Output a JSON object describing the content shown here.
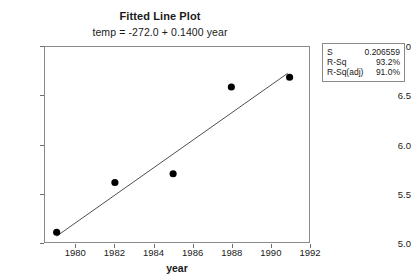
{
  "chart_data": {
    "type": "scatter",
    "title": "Fitted Line Plot",
    "subtitle": "temp =  -272.0 + 0.1400 year",
    "xlabel": "year",
    "ylabel": "temp",
    "xlim": [
      1978.4,
      1992.0
    ],
    "ylim": [
      5.0,
      7.0
    ],
    "grid": false,
    "legend": "none",
    "x": [
      1979,
      1982,
      1985,
      1988,
      1991
    ],
    "y": [
      5.1,
      5.61,
      5.7,
      6.59,
      6.69
    ],
    "xticks": [
      "1980",
      "1982",
      "1984",
      "1986",
      "1988",
      "1990",
      "1992"
    ],
    "xtick_values": [
      1980,
      1982,
      1984,
      1986,
      1988,
      1990,
      1992
    ],
    "yticks": [
      "7.0",
      "6.5",
      "6.0",
      "5.5",
      "5.0"
    ],
    "ytick_values": [
      7.0,
      6.5,
      6.0,
      5.5,
      5.0
    ],
    "series": [
      {
        "name": "observed",
        "type": "scatter",
        "marker": "filled-circle",
        "color": "#000000",
        "values": [
          5.1,
          5.61,
          5.7,
          6.59,
          6.69
        ]
      },
      {
        "name": "fitted-line",
        "type": "line",
        "color": "#4d4d4d",
        "intercept": -272.0,
        "slope": 0.14,
        "x_endpoints": [
          1979.0,
          1990.9
        ],
        "y_endpoints": [
          5.06,
          6.73
        ]
      }
    ],
    "annotations": {
      "equation": "temp =  -272.0 + 0.1400 year"
    }
  },
  "stats": {
    "rows": [
      {
        "key": "S",
        "value": "0.206559"
      },
      {
        "key": "R-Sq",
        "value": "93.2%"
      },
      {
        "key": "R-Sq(adj)",
        "value": "91.0%"
      }
    ]
  },
  "colors": {
    "axis": "#8a8a8a",
    "marker": "#000000",
    "line": "#4d4d4d",
    "text": "#1a1a1a",
    "background": "#ffffff"
  }
}
